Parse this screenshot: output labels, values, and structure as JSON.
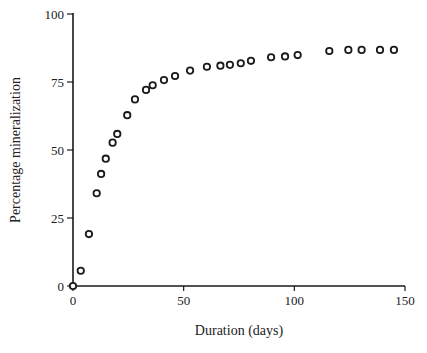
{
  "chart_data": {
    "type": "scatter",
    "title": "",
    "xlabel": "Duration (days)",
    "ylabel": "Percentage mineralization",
    "xlim": [
      0,
      150
    ],
    "ylim": [
      0,
      100
    ],
    "xticks": [
      0,
      50,
      100,
      150
    ],
    "yticks": [
      0,
      25,
      50,
      75,
      100
    ],
    "grid": false,
    "legend": null,
    "series": [
      {
        "name": "mineralization",
        "marker": "open-circle",
        "x": [
          0,
          3.5,
          7.2,
          10.7,
          12.7,
          14.8,
          17.9,
          20.0,
          24.5,
          28.0,
          33.0,
          36.0,
          41.1,
          46.1,
          52.9,
          60.5,
          66.6,
          70.9,
          75.8,
          80.4,
          89.5,
          95.8,
          101.5,
          115.8,
          124.4,
          130.4,
          138.7,
          145.0
        ],
        "y": [
          0,
          5.6,
          19.1,
          34.1,
          41.2,
          46.8,
          52.7,
          55.9,
          62.8,
          68.6,
          72.1,
          73.8,
          75.7,
          77.2,
          79.2,
          80.6,
          81.0,
          81.3,
          81.9,
          82.8,
          84.1,
          84.4,
          84.9,
          86.4,
          86.8,
          86.8,
          86.8,
          86.8
        ]
      }
    ]
  }
}
